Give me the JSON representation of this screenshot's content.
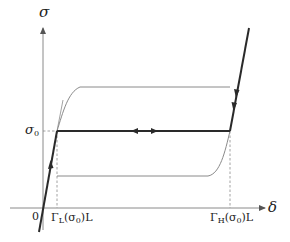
{
  "diagram": {
    "y_axis_label": "σ",
    "x_axis_label": "δ",
    "origin_label": "0",
    "sigma0_label": "σ",
    "sigma0_subscript": "0",
    "gamma_L_label": {
      "symbol": "Γ",
      "sub": "L",
      "arg_open": "(σ",
      "arg_sub": "0",
      "arg_close": ")L"
    },
    "gamma_H_label": {
      "symbol": "Γ",
      "sub": "H",
      "arg_open": "(σ",
      "arg_sub": "0",
      "arg_close": ")L"
    },
    "colors": {
      "thick_path": "#2a2a2a",
      "thin_curve": "#8a8a8a",
      "axis": "#8a8a8a",
      "dashed": "#8a8a8a"
    },
    "elements": {
      "elastic_branch_left": "thick line through origin rising to σ0 plateau with upward arrow",
      "plateau": "thick horizontal line at σ0 between Γ_L(σ0)L and Γ_H(σ0)L with arrows in both directions",
      "elastic_branch_right": "thick line rising above Γ_H(σ0)L with downward arrows",
      "upper_curve": "thin curve from σ0 at Γ_L rising to upper plateau",
      "lower_curve": "thin lower plateau rising to σ0 at Γ_H"
    }
  }
}
